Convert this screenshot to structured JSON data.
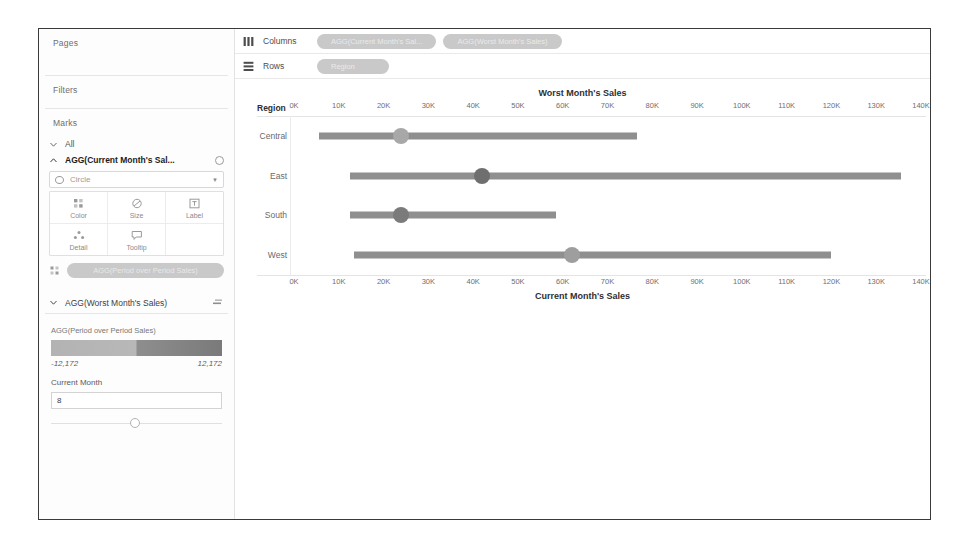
{
  "sidebar": {
    "pages_label": "Pages",
    "filters_label": "Filters",
    "marks_label": "Marks",
    "all_label": "All",
    "active_card_label": "AGG(Current Month's Sal...",
    "mark_type": "Circle",
    "buttons": [
      {
        "label": "Color",
        "icon": "color-icon"
      },
      {
        "label": "Size",
        "icon": "size-icon"
      },
      {
        "label": "Label",
        "icon": "label-icon"
      },
      {
        "label": "Detail",
        "icon": "detail-icon"
      },
      {
        "label": "Tooltip",
        "icon": "tooltip-icon"
      }
    ],
    "color_pill": "AGG(Period over Period Sales)",
    "worst_card_label": "AGG(Worst Month's Sales)",
    "legend": {
      "title": "AGG(Period over Period Sales)",
      "min": "-12,172",
      "max": "12,172",
      "low_color": "#b3b3b3",
      "high_color": "#7a7a7a"
    },
    "parameter": {
      "label": "Current Month",
      "value": "8"
    }
  },
  "shelves": {
    "columns_label": "Columns",
    "rows_label": "Rows",
    "columns_pills": [
      "AGG(Current Month's Sal...",
      "AGG(Worst Month's Sales)"
    ],
    "rows_pills": [
      "Region"
    ]
  },
  "chart_data": {
    "type": "bar",
    "title": "Worst Month's Sales",
    "xlabel": "Current Month's Sales",
    "ylabel": "Region",
    "row_header": "Region",
    "categories": [
      "Central",
      "East",
      "South",
      "West"
    ],
    "xlim": [
      0,
      140000
    ],
    "ticks": [
      "0K",
      "10K",
      "20K",
      "30K",
      "40K",
      "50K",
      "60K",
      "70K",
      "80K",
      "90K",
      "100K",
      "110K",
      "120K",
      "130K",
      "140K"
    ],
    "tick_values": [
      0,
      10000,
      20000,
      30000,
      40000,
      50000,
      60000,
      70000,
      80000,
      90000,
      100000,
      110000,
      120000,
      130000,
      140000
    ],
    "grid": false,
    "legend_position": "left-sidebar",
    "series": [
      {
        "name": "Worst Month's Sales (bar start)",
        "values": [
          5500,
          12500,
          12500,
          13500
        ]
      },
      {
        "name": "Current Month's Sales (bar end)",
        "values": [
          76500,
          135500,
          58500,
          120000
        ]
      },
      {
        "name": "AGG(Current Month's Sales) (circle)",
        "values": [
          24000,
          42000,
          24000,
          62000
        ]
      }
    ],
    "circle_colors": [
      "#a8a8a8",
      "#6f6f6f",
      "#7b7b7b",
      "#9e9e9e"
    ],
    "bar_color": "#8f8f8f"
  }
}
